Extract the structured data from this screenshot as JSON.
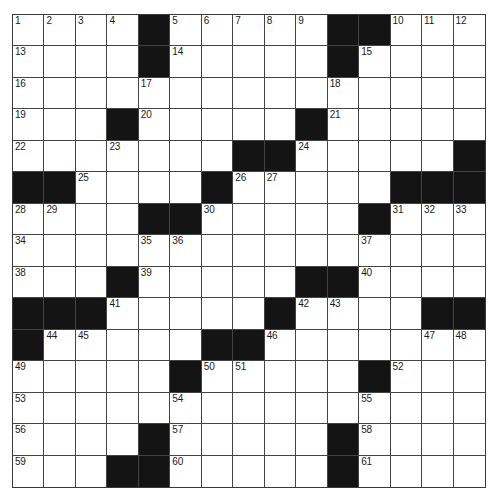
{
  "puzzle": {
    "rows": 15,
    "cols": 15,
    "colors": {
      "block": "#141414",
      "cell": "#ffffff",
      "line": "#444444"
    },
    "legend": "Each row string: '#' = black square, '.' = white square. numbers[] lists clue numbers with [row, col].",
    "grid": [
      "....#.....##...",
      "....#.....#....",
      "...............",
      "...#.....#.....",
      ".......##.....#",
      "##....#.....###",
      "....##.....#...",
      "...............",
      "...#.....##....",
      "###.....#....##",
      "#.....##.......",
      ".....#.....#...",
      "...............",
      "....#.....#....",
      "...##.....#...."
    ],
    "numbers": [
      {
        "n": 1,
        "r": 0,
        "c": 0
      },
      {
        "n": 2,
        "r": 0,
        "c": 1
      },
      {
        "n": 3,
        "r": 0,
        "c": 2
      },
      {
        "n": 4,
        "r": 0,
        "c": 3
      },
      {
        "n": 5,
        "r": 0,
        "c": 5
      },
      {
        "n": 6,
        "r": 0,
        "c": 6
      },
      {
        "n": 7,
        "r": 0,
        "c": 7
      },
      {
        "n": 8,
        "r": 0,
        "c": 8
      },
      {
        "n": 9,
        "r": 0,
        "c": 9
      },
      {
        "n": 10,
        "r": 0,
        "c": 12
      },
      {
        "n": 11,
        "r": 0,
        "c": 13
      },
      {
        "n": 12,
        "r": 0,
        "c": 14
      },
      {
        "n": 13,
        "r": 1,
        "c": 0
      },
      {
        "n": 14,
        "r": 1,
        "c": 5
      },
      {
        "n": 15,
        "r": 1,
        "c": 11
      },
      {
        "n": 16,
        "r": 2,
        "c": 0
      },
      {
        "n": 17,
        "r": 2,
        "c": 4
      },
      {
        "n": 18,
        "r": 2,
        "c": 10
      },
      {
        "n": 19,
        "r": 3,
        "c": 0
      },
      {
        "n": 20,
        "r": 3,
        "c": 4
      },
      {
        "n": 21,
        "r": 3,
        "c": 10
      },
      {
        "n": 22,
        "r": 4,
        "c": 0
      },
      {
        "n": 23,
        "r": 4,
        "c": 3
      },
      {
        "n": 24,
        "r": 4,
        "c": 9
      },
      {
        "n": 25,
        "r": 5,
        "c": 2
      },
      {
        "n": 26,
        "r": 5,
        "c": 7
      },
      {
        "n": 27,
        "r": 5,
        "c": 8
      },
      {
        "n": 28,
        "r": 6,
        "c": 0
      },
      {
        "n": 29,
        "r": 6,
        "c": 1
      },
      {
        "n": 30,
        "r": 6,
        "c": 6
      },
      {
        "n": 31,
        "r": 6,
        "c": 12
      },
      {
        "n": 32,
        "r": 6,
        "c": 13
      },
      {
        "n": 33,
        "r": 6,
        "c": 14
      },
      {
        "n": 34,
        "r": 7,
        "c": 0
      },
      {
        "n": 35,
        "r": 7,
        "c": 4
      },
      {
        "n": 36,
        "r": 7,
        "c": 5
      },
      {
        "n": 37,
        "r": 7,
        "c": 11
      },
      {
        "n": 38,
        "r": 8,
        "c": 0
      },
      {
        "n": 39,
        "r": 8,
        "c": 4
      },
      {
        "n": 40,
        "r": 8,
        "c": 11
      },
      {
        "n": 41,
        "r": 9,
        "c": 3
      },
      {
        "n": 42,
        "r": 9,
        "c": 9
      },
      {
        "n": 43,
        "r": 9,
        "c": 10
      },
      {
        "n": 44,
        "r": 10,
        "c": 1
      },
      {
        "n": 45,
        "r": 10,
        "c": 2
      },
      {
        "n": 46,
        "r": 10,
        "c": 8
      },
      {
        "n": 47,
        "r": 10,
        "c": 13
      },
      {
        "n": 48,
        "r": 10,
        "c": 14
      },
      {
        "n": 49,
        "r": 11,
        "c": 0
      },
      {
        "n": 50,
        "r": 11,
        "c": 6
      },
      {
        "n": 51,
        "r": 11,
        "c": 7
      },
      {
        "n": 52,
        "r": 11,
        "c": 12
      },
      {
        "n": 53,
        "r": 12,
        "c": 0
      },
      {
        "n": 54,
        "r": 12,
        "c": 5
      },
      {
        "n": 55,
        "r": 12,
        "c": 11
      },
      {
        "n": 56,
        "r": 13,
        "c": 0
      },
      {
        "n": 57,
        "r": 13,
        "c": 5
      },
      {
        "n": 58,
        "r": 13,
        "c": 11
      },
      {
        "n": 59,
        "r": 14,
        "c": 0
      },
      {
        "n": 60,
        "r": 14,
        "c": 5
      },
      {
        "n": 61,
        "r": 14,
        "c": 11
      }
    ],
    "entries": {}
  }
}
